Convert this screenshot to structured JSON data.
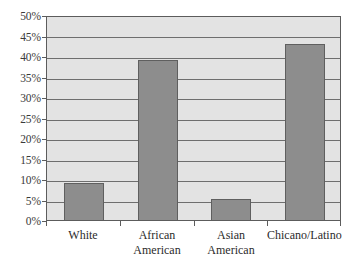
{
  "chart_data": {
    "type": "bar",
    "title": "",
    "subtitle": "",
    "xlabel": "",
    "ylabel": "",
    "categories": [
      "White",
      "African American",
      "Asian American",
      "Chicano/Latino"
    ],
    "category_lines": [
      [
        "White"
      ],
      [
        "African",
        "American"
      ],
      [
        "Asian",
        "American"
      ],
      [
        "Chicano/Latino"
      ]
    ],
    "values": [
      9,
      39,
      5,
      43
    ],
    "value_labels": [
      "9%",
      "39%",
      "5%",
      "43%"
    ],
    "ylim": [
      0,
      50
    ],
    "ytick_step": 5,
    "ytick_labels": [
      "50%",
      "45%",
      "40%",
      "35%",
      "30%",
      "25%",
      "20%",
      "15%",
      "10%",
      "5%",
      "0%"
    ],
    "ytick_values": [
      50,
      45,
      40,
      35,
      30,
      25,
      20,
      15,
      10,
      5,
      0
    ],
    "grid": true,
    "legend": false,
    "legend_position": "none",
    "series": [
      {
        "name": "",
        "values": [
          9,
          39,
          5,
          43
        ]
      }
    ]
  },
  "style": {
    "bar_color": "#8d8d8d",
    "bar_border_color": "#5f5f5f",
    "plot_background": "#e3e3e3",
    "page_background": "#ffffff",
    "gridline_color": "#6e6e6e",
    "axis_color": "#5c5c5c",
    "text_color": "#2b2b2b"
  }
}
